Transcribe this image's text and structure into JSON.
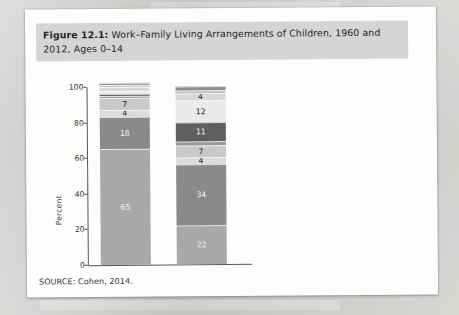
{
  "caption": {
    "figure_number": "Figure 12.1:",
    "text": " Work–Family Living Arrangements of Children, 1960 and 2012, Ages 0–14"
  },
  "source": "SOURCE: Cohen, 2014.",
  "colors": {
    "neither_parent_nor_grandparents": "#8d8d8d",
    "with_grandparents_only": "#c4c4c4",
    "single_father": "#d8d8d8",
    "formerly_married_mother": "#eaeaea",
    "never_married_mother": "#5f5f5f",
    "cohabiting_parent": "#9a9a9a",
    "married_neither_employed": "#c9c9c9",
    "married_mother_only_employed": "#dcdcdc",
    "married_both_employed": "#8a8a8a",
    "married_father_only_employed": "#a9a9a9",
    "caption_band": "#d5d5d3",
    "page": "#fdfdfc",
    "backdrop": "#c9c9c6"
  },
  "chart_data": {
    "type": "bar",
    "subtype": "stacked-column-100",
    "title": "Work–Family Living Arrangements of Children, 1960 and 2012, Ages 0–14",
    "xlabel": "",
    "ylabel": "Percent",
    "ylim": [
      0,
      100
    ],
    "yticks": [
      0,
      20,
      40,
      60,
      80,
      100
    ],
    "grid": false,
    "legend_position": "right",
    "categories": [
      "1960",
      "2012"
    ],
    "stack_order_bottom_to_top": [
      "Married parents, father only employed",
      "Married parents, both employed",
      "Married parents, mother only employed",
      "Married parents, neither employed",
      "Cohabiting parent",
      "Never-married mother",
      "Formerly-married mother",
      "Single father",
      "With grandparents only",
      "Neither parent nor grandparents"
    ],
    "series": [
      {
        "name": "Married parents, father only employed",
        "color": "#a9a9a9",
        "values": [
          65,
          22
        ]
      },
      {
        "name": "Married parents, both employed",
        "color": "#8a8a8a",
        "values": [
          18,
          34
        ]
      },
      {
        "name": "Married parents, mother only employed",
        "color": "#dcdcdc",
        "values": [
          4,
          4
        ]
      },
      {
        "name": "Married parents, neither employed",
        "color": "#c9c9c9",
        "values": [
          7,
          7
        ]
      },
      {
        "name": "Cohabiting parent",
        "color": "#9a9a9a",
        "values": [
          1,
          2
        ]
      },
      {
        "name": "Never-married mother",
        "color": "#5f5f5f",
        "values": [
          1,
          11
        ]
      },
      {
        "name": "Formerly-married mother",
        "color": "#eaeaea",
        "values": [
          2,
          12
        ]
      },
      {
        "name": "Single father",
        "color": "#d8d8d8",
        "values": [
          2,
          4
        ]
      },
      {
        "name": "With grandparents only",
        "color": "#c4c4c4",
        "values": [
          1,
          2
        ]
      },
      {
        "name": "Neither parent nor grandparents",
        "color": "#8d8d8d",
        "values": [
          1,
          2
        ]
      }
    ],
    "bar_1960_labels_bottom_to_top": [
      "65",
      "18",
      "4",
      "7",
      "1",
      "1",
      "2",
      "2",
      "1",
      "1"
    ],
    "bar_2012_labels_bottom_to_top": [
      "22",
      "34",
      "4",
      "7",
      "2",
      "11",
      "12",
      "4",
      "2",
      "2"
    ],
    "callouts_left_1960": [
      {
        "label": "1",
        "percent_position": 80
      },
      {
        "label": "1",
        "percent_position": 95
      },
      {
        "label": "2",
        "percent_position": 97
      },
      {
        "label": "2",
        "percent_position": 99
      }
    ],
    "callouts_right_2012": [
      {
        "label": "2",
        "percent_position": 62
      },
      {
        "label": "2",
        "percent_position": 95
      },
      {
        "label": "2",
        "percent_position": 97
      },
      {
        "label": "4",
        "percent_position": 99
      }
    ]
  },
  "legend": {
    "items": [
      {
        "label": "Neither parent nor grandparents",
        "color": "#8d8d8d"
      },
      {
        "label": "With grandparents only",
        "color": "#c4c4c4"
      },
      {
        "label": "Single father",
        "color": "#d8d8d8"
      },
      {
        "label": "Formerly-married mother",
        "color": "#eaeaea"
      },
      {
        "label": "Never-married mother",
        "color": "#5f5f5f"
      },
      {
        "label": "Cohabiting parent",
        "color": "#9a9a9a"
      },
      {
        "label": "Married parents, neither employed",
        "color": "#c9c9c9"
      },
      {
        "label": "Married parents, mother only employed",
        "color": "#dcdcdc"
      },
      {
        "label": "Married parents, both employed",
        "color": "#8a8a8a"
      },
      {
        "label": "Married parents, father only employed",
        "color": "#a9a9a9"
      }
    ]
  },
  "axis": {
    "ytick_labels": [
      "100",
      "80",
      "60",
      "40",
      "20",
      "0"
    ],
    "xtick_labels": [
      "1960",
      "2012"
    ],
    "ylabel": "Percent"
  }
}
